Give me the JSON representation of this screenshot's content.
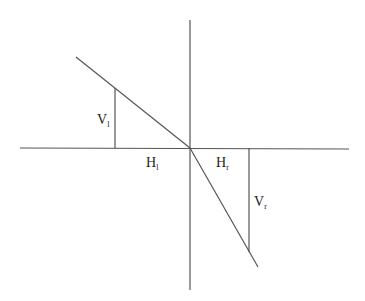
{
  "diagram": {
    "colors": {
      "line": "#555555",
      "text": "#222222",
      "background": "#ffffff"
    },
    "labels": {
      "v_left": {
        "main": "V",
        "sub": "l"
      },
      "h_left": {
        "main": "H",
        "sub": "l"
      },
      "h_right": {
        "main": "H",
        "sub": "r"
      },
      "v_right": {
        "main": "V",
        "sub": "r"
      }
    }
  }
}
